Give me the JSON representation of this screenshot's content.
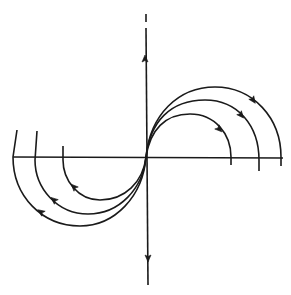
{
  "diagram": {
    "type": "phase-portrait",
    "stroke_color": "#1a1a1a",
    "background": "#ffffff",
    "origin": {
      "x": 146,
      "y": 157
    },
    "axes": {
      "horizontal": {
        "x1": 13,
        "y1": 157,
        "x2": 283,
        "y2": 158
      },
      "vertical": {
        "x1": 146,
        "y1": 14,
        "x2": 148,
        "y2": 285,
        "gap_y": [
          22,
          28
        ]
      },
      "arrows": [
        {
          "name": "up-arrow",
          "x": 145,
          "y": 59,
          "direction": "up"
        },
        {
          "name": "down-arrow",
          "x": 148,
          "y": 258,
          "direction": "down"
        }
      ]
    },
    "trajectories": [
      {
        "name": "inner",
        "right_path": "M146,157 C150,130 165,114 190,114 C215,114 231,134 231,157 L231,165",
        "left_path": "M146,157 C143,182 125,200 100,200 C78,200 63,180 63,160 L63,146",
        "right_arrow": {
          "x": 219,
          "y": 129,
          "angle": 45
        },
        "left_arrow": {
          "x": 74,
          "y": 187,
          "angle": 225
        }
      },
      {
        "name": "middle",
        "right_path": "M146,157 C150,122 170,100 205,100 C238,100 259,126 259,160 L259,171",
        "left_path": "M146,157 C143,188 120,214 88,214 C57,214 35,188 35,160 L37,131",
        "right_arrow": {
          "x": 241,
          "y": 115,
          "angle": 50
        },
        "left_arrow": {
          "x": 54,
          "y": 200,
          "angle": 220
        }
      },
      {
        "name": "outer",
        "right_path": "M146,157 C150,115 178,87 215,87 C253,87 281,118 281,157 L281,166",
        "left_path": "M146,157 C143,196 115,226 80,226 C42,226 13,196 13,157 L17,130",
        "right_arrow": {
          "x": 253,
          "y": 100,
          "angle": 55
        },
        "left_arrow": {
          "x": 41,
          "y": 212,
          "angle": 215
        }
      }
    ]
  }
}
